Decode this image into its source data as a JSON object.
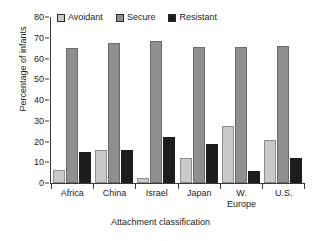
{
  "chart_data": {
    "type": "bar",
    "title": "",
    "xlabel": "Attachment classification",
    "ylabel": "Percentage of infants",
    "ylim": [
      0,
      80
    ],
    "yticks": [
      0,
      10,
      20,
      30,
      40,
      50,
      60,
      70,
      80
    ],
    "grid": false,
    "legend_position": "top-left-inside",
    "categories": [
      "Africa",
      "China",
      "Israel",
      "Japan",
      "W. Europe",
      "U.S."
    ],
    "category_lines": [
      {
        "line1": "Africa",
        "line2": ""
      },
      {
        "line1": "China",
        "line2": ""
      },
      {
        "line1": "Israel",
        "line2": ""
      },
      {
        "line1": "Japan",
        "line2": ""
      },
      {
        "line1": "W.",
        "line2": "Europe"
      },
      {
        "line1": "U.S.",
        "line2": ""
      }
    ],
    "series": [
      {
        "name": "Avoidant",
        "color": "#c9c9c9",
        "values": [
          6.5,
          16.0,
          2.5,
          12.0,
          27.5,
          20.5
        ]
      },
      {
        "name": "Secure",
        "color": "#8f8f8f",
        "values": [
          65.0,
          67.5,
          68.5,
          65.5,
          65.5,
          66.0
        ]
      },
      {
        "name": "Resistant",
        "color": "#1d1d1d",
        "values": [
          15.0,
          16.0,
          22.0,
          19.0,
          6.0,
          12.0
        ]
      }
    ]
  },
  "legend": {
    "entries": [
      {
        "label": "Avoidant"
      },
      {
        "label": "Secure"
      },
      {
        "label": "Resistant"
      }
    ]
  },
  "axes": {
    "y_title": "Percentage of infants",
    "x_title": "Attachment classification",
    "y_tick_labels": [
      "80",
      "70",
      "60",
      "50",
      "40",
      "30",
      "20",
      "10",
      "0"
    ]
  }
}
